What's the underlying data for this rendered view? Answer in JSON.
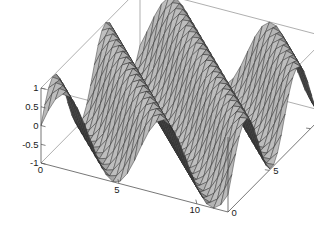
{
  "figure": {
    "title": "",
    "background_color": "#ffffff",
    "width": 314,
    "height": 240
  },
  "chart_data": {
    "type": "surface",
    "title": "",
    "xlabel": "",
    "ylabel": "",
    "zlabel": "",
    "function": "z = sin(x + y)",
    "xlim": [
      0,
      12
    ],
    "ylim": [
      0,
      12
    ],
    "zlim": [
      -1,
      1
    ],
    "x_ticks": [
      0,
      5,
      10
    ],
    "x_tick_labels": [
      "0",
      "5",
      "10"
    ],
    "y_ticks": [
      0,
      5,
      10
    ],
    "y_tick_labels": [
      "0",
      "5",
      "10"
    ],
    "z_ticks": [
      -1,
      -0.5,
      0,
      0.5,
      1
    ],
    "z_tick_labels": [
      "-1",
      "-0.5",
      "0",
      "0.5",
      "1"
    ],
    "grid": true,
    "mesh_divisions_x": 26,
    "mesh_divisions_y": 26,
    "legend": null,
    "surface_color": "#6b6b6b",
    "mesh_line_color": "#2b2b2b",
    "box_color": "#4a4a4a",
    "shaded": true
  },
  "axes": {
    "z_axis": {
      "name": "vertical-axis",
      "labels": [
        "1",
        "0.5",
        "0",
        "-0.5",
        "-1"
      ]
    },
    "x_axis": {
      "name": "front-left-axis",
      "labels": [
        "0",
        "5",
        "10"
      ]
    },
    "y_axis": {
      "name": "front-right-axis",
      "labels": [
        "0",
        "5",
        "10"
      ]
    }
  },
  "tick_labels": {
    "z_1": "1",
    "z_05": "0.5",
    "z_0": "0",
    "z_m05": "-0.5",
    "z_m1": "-1",
    "x_origin": "0",
    "x_5": "5",
    "x_10": "10",
    "y_origin": "0",
    "y_5": "5",
    "y_10": "10"
  }
}
